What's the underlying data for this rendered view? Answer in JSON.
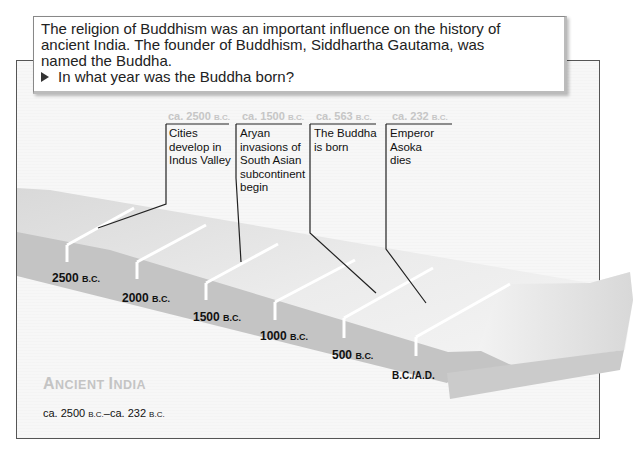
{
  "question_card": {
    "intro": "The religion of Buddhism was an important influence on the history of ancient India. The founder of Buddhism, Siddhartha Gautama, was named the Buddha.",
    "bullet_icon": "right-triangle-bullet",
    "question": "In what year was the Buddha born?"
  },
  "timeline": {
    "title_big1": "A",
    "title_small1": "NCIENT ",
    "title_big2": "I",
    "title_small2": "NDIA",
    "title_full": "Ancient India",
    "range_prefix": "ca. 2500 ",
    "range_era1": "B.C.",
    "range_mid": "–ca. 232 ",
    "range_era2": "B.C.",
    "ticks": [
      {
        "year": "2500",
        "era": "B.C."
      },
      {
        "year": "2000",
        "era": "B.C."
      },
      {
        "year": "1500",
        "era": "B.C."
      },
      {
        "year": "1000",
        "era": "B.C."
      },
      {
        "year": "500",
        "era": "B.C."
      },
      {
        "year": "",
        "era": "B.C./A.D."
      }
    ],
    "events": [
      {
        "date": "ca. 2500",
        "era": "B.C.",
        "label": "Cities develop in Indus Valley"
      },
      {
        "date": "ca. 1500",
        "era": "B.C.",
        "label": "Aryan invasions of South Asian subcontinent begin"
      },
      {
        "date": "ca. 563",
        "era": "B.C.",
        "label": "The Buddha is born"
      },
      {
        "date": "ca. 232",
        "era": "B.C.",
        "label": "Emperor Asoka dies"
      }
    ],
    "colors": {
      "beam_top": "#e6e6e6",
      "beam_front": "#bdbdbd",
      "date_label": "#c6c6c6",
      "title": "#c4c4c4"
    }
  }
}
